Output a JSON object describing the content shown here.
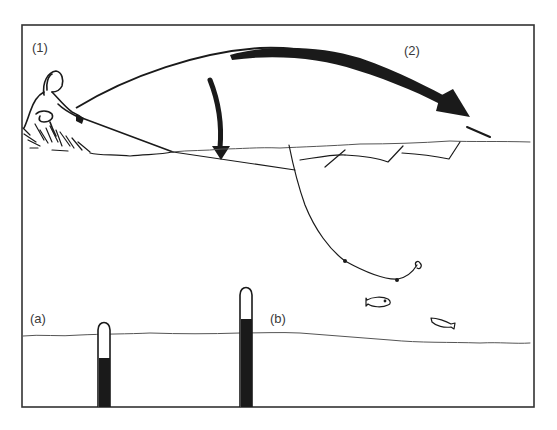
{
  "figure": {
    "labels": {
      "stage_1": "(1)",
      "stage_2": "(2)",
      "gauge_a": "(a)",
      "gauge_b": "(b)"
    },
    "colors": {
      "ink": "#1a1a1a",
      "frame": "#333333",
      "background": "#ffffff"
    },
    "elements": {
      "angler": "figure crouching on bank with rod",
      "cast_arrow": "large curved arrow showing cast trajectory",
      "drop_arrow": "curved arrow pointing down to the water line",
      "surface_line": "wavy water surface line",
      "leaders": "zigzag leader lines below surface",
      "hook_line": "descending line ending in hook",
      "fish": [
        "fish-left",
        "fish-right"
      ],
      "gauges": [
        {
          "label": "(a)",
          "fill_level": "low"
        },
        {
          "label": "(b)",
          "fill_level": "high"
        }
      ],
      "bottom_line": "wavy lower water line"
    }
  }
}
